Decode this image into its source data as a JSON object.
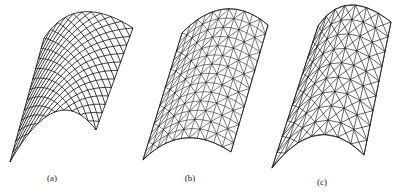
{
  "figure": {
    "panels": [
      {
        "id": "a",
        "label": "(a)",
        "label_pos": [
          52,
          182
        ],
        "pattern": "quad-diagonal",
        "grid": {
          "u": 10,
          "v": 12
        },
        "corners": {
          "top_left": [
            44,
            38
          ],
          "top_right": [
            133,
            28
          ],
          "bottom_left": [
            10,
            162
          ],
          "bottom_right": [
            96,
            130
          ]
        },
        "top_bulge": [
          82,
          12
        ],
        "bottom_sag": [
          55,
          112
        ],
        "stroke": "#1a1a1a"
      },
      {
        "id": "b",
        "label": "(b)",
        "label_pos": [
          190,
          182
        ],
        "pattern": "triangulated-quad",
        "grid": {
          "u": 11,
          "v": 14
        },
        "corners": {
          "top_left": [
            182,
            33
          ],
          "top_right": [
            268,
            25
          ],
          "bottom_left": [
            143,
            160
          ],
          "bottom_right": [
            231,
            152
          ]
        },
        "top_bulge": [
          225,
          9
        ],
        "bottom_sag": [
          185,
          138
        ],
        "stroke": "#222222"
      },
      {
        "id": "c",
        "label": "(c)",
        "label_pos": [
          322,
          186
        ],
        "pattern": "kiewitt-x",
        "grid": {
          "u": 7,
          "v": 9
        },
        "corners": {
          "top_left": [
            318,
            26
          ],
          "top_right": [
            391,
            22
          ],
          "bottom_left": [
            272,
            168
          ],
          "bottom_right": [
            364,
            155
          ]
        },
        "top_bulge": [
          350,
          5
        ],
        "bottom_sag": [
          318,
          135
        ],
        "stroke": "#222222"
      }
    ]
  }
}
